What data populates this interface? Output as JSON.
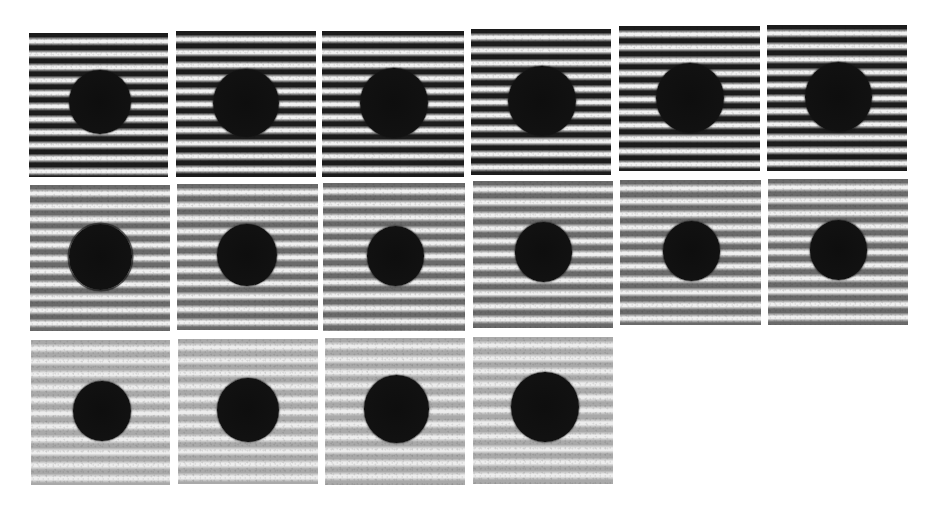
{
  "figure": {
    "background": "#ffffff",
    "fringe_period_px": 13,
    "rows": [
      {
        "row": 1,
        "contrast": "high",
        "dark": "#1c1c1c",
        "light": "#f2f2f2",
        "panels": [
          {
            "id": 1,
            "x": 29,
            "y": 33,
            "w": 139,
            "h": 144,
            "dot": {
              "cx": 100,
              "cy": 102,
              "d": 62,
              "spiky": false
            }
          },
          {
            "id": 2,
            "x": 176,
            "y": 31,
            "w": 140,
            "h": 146,
            "dot": {
              "cx": 246,
              "cy": 103,
              "d": 66,
              "spiky": false
            }
          },
          {
            "id": 3,
            "x": 322,
            "y": 31,
            "w": 142,
            "h": 146,
            "dot": {
              "cx": 394,
              "cy": 103,
              "d": 68,
              "spiky": false
            }
          },
          {
            "id": 4,
            "x": 471,
            "y": 29,
            "w": 140,
            "h": 146,
            "dot": {
              "cx": 542,
              "cy": 101,
              "d": 68,
              "spiky": false
            }
          },
          {
            "id": 5,
            "x": 619,
            "y": 26,
            "w": 141,
            "h": 145,
            "dot": {
              "cx": 690,
              "cy": 98,
              "d": 68,
              "spiky": false
            }
          },
          {
            "id": 6,
            "x": 767,
            "y": 25,
            "w": 140,
            "h": 146,
            "dot": {
              "cx": 838,
              "cy": 97,
              "d": 67,
              "spiky": false
            }
          }
        ]
      },
      {
        "row": 2,
        "contrast": "medium",
        "dark": "#6a6a6a",
        "light": "#f0f0f0",
        "panels": [
          {
            "id": 7,
            "x": 30,
            "y": 185,
            "w": 140,
            "h": 146,
            "dot": {
              "cx": 100,
              "cy": 257,
              "d": 63,
              "spiky": true
            }
          },
          {
            "id": 8,
            "x": 177,
            "y": 184,
            "w": 141,
            "h": 146,
            "dot": {
              "cx": 247,
              "cy": 255,
              "d": 60,
              "spiky": false
            }
          },
          {
            "id": 9,
            "x": 323,
            "y": 183,
            "w": 142,
            "h": 148,
            "dot": {
              "cx": 395,
              "cy": 256,
              "d": 57,
              "spiky": false
            }
          },
          {
            "id": 10,
            "x": 473,
            "y": 181,
            "w": 140,
            "h": 147,
            "dot": {
              "cx": 543,
              "cy": 252,
              "d": 57,
              "spiky": false
            }
          },
          {
            "id": 11,
            "x": 620,
            "y": 180,
            "w": 141,
            "h": 145,
            "dot": {
              "cx": 691,
              "cy": 251,
              "d": 57,
              "spiky": false
            }
          },
          {
            "id": 12,
            "x": 768,
            "y": 179,
            "w": 140,
            "h": 146,
            "dot": {
              "cx": 838,
              "cy": 250,
              "d": 57,
              "spiky": false
            }
          }
        ]
      },
      {
        "row": 3,
        "contrast": "low",
        "dark": "#a9a9a9",
        "light": "#ededed",
        "panels": [
          {
            "id": 13,
            "x": 31,
            "y": 340,
            "w": 139,
            "h": 145,
            "dot": {
              "cx": 102,
              "cy": 411,
              "d": 58,
              "spiky": false
            }
          },
          {
            "id": 14,
            "x": 178,
            "y": 339,
            "w": 140,
            "h": 145,
            "dot": {
              "cx": 248,
              "cy": 410,
              "d": 62,
              "spiky": false
            }
          },
          {
            "id": 15,
            "x": 325,
            "y": 338,
            "w": 140,
            "h": 147,
            "dot": {
              "cx": 396,
              "cy": 409,
              "d": 65,
              "spiky": false
            }
          },
          {
            "id": 16,
            "x": 473,
            "y": 337,
            "w": 140,
            "h": 147,
            "dot": {
              "cx": 545,
              "cy": 407,
              "d": 68,
              "spiky": false
            }
          }
        ]
      }
    ]
  }
}
